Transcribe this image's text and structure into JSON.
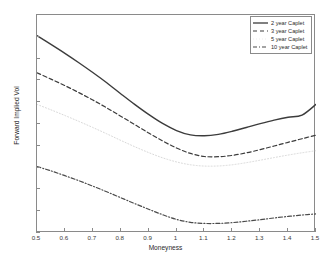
{
  "chart_data": {
    "type": "line",
    "title": "",
    "xlabel": "Moneyness",
    "ylabel": "Forward Implied Vol",
    "xlim": [
      0.5,
      1.5
    ],
    "ylim": [
      0.12,
      0.32
    ],
    "xticks": [
      "0.5",
      "0.6",
      "0.7",
      "0.8",
      "0.9",
      "1",
      "1.1",
      "1.2",
      "1.3",
      "1.4",
      "1.5"
    ],
    "xtick_values": [
      0.5,
      0.6,
      0.7,
      0.8,
      0.9,
      1.0,
      1.1,
      1.2,
      1.3,
      1.4,
      1.5
    ],
    "yticks": [
      "0.12",
      "0.14",
      "0.16",
      "0.18",
      "0.2",
      "0.22",
      "0.24",
      "0.26",
      "0.28",
      "0.3",
      "0.32"
    ],
    "ytick_values": [
      0.12,
      0.14,
      0.16,
      0.18,
      0.2,
      0.22,
      0.24,
      0.26,
      0.28,
      0.3,
      0.32
    ],
    "grid": false,
    "legend_position": "top-right",
    "x": [
      0.5,
      0.55,
      0.6,
      0.65,
      0.7,
      0.75,
      0.8,
      0.85,
      0.9,
      0.95,
      1.0,
      1.05,
      1.1,
      1.15,
      1.2,
      1.25,
      1.3,
      1.35,
      1.4,
      1.45,
      1.5
    ],
    "series": [
      {
        "name": "2 year Caplet",
        "style": "solid",
        "color": "#3c3c3c",
        "values": [
          0.301,
          0.293,
          0.2848,
          0.2762,
          0.2672,
          0.2578,
          0.2478,
          0.238,
          0.2288,
          0.2205,
          0.214,
          0.21,
          0.2092,
          0.2105,
          0.2133,
          0.2168,
          0.2203,
          0.2235,
          0.2262,
          0.2282,
          0.238
        ]
      },
      {
        "name": "3 year Caplet",
        "style": "dashed",
        "color": "#3c3c3c",
        "values": [
          0.267,
          0.2612,
          0.2552,
          0.2488,
          0.242,
          0.2348,
          0.2272,
          0.2195,
          0.2118,
          0.2045,
          0.198,
          0.193,
          0.1902,
          0.19,
          0.1912,
          0.1935,
          0.1965,
          0.1998,
          0.2032,
          0.2065,
          0.2098
        ]
      },
      {
        "name": "5 year Caplet",
        "style": "dotted-faint",
        "color": "#d8d8d8",
        "values": [
          0.238,
          0.233,
          0.2278,
          0.2224,
          0.2168,
          0.211,
          0.205,
          0.1992,
          0.1938,
          0.189,
          0.1852,
          0.1826,
          0.1814,
          0.1815,
          0.1826,
          0.1845,
          0.1868,
          0.1892,
          0.1915,
          0.1936,
          0.1955
        ]
      },
      {
        "name": "10 year Caplet",
        "style": "dash-dot",
        "color": "#4a4a4a",
        "values": [
          0.181,
          0.177,
          0.1726,
          0.168,
          0.163,
          0.1578,
          0.1524,
          0.147,
          0.1418,
          0.1368,
          0.1325,
          0.1298,
          0.1288,
          0.1288,
          0.1295,
          0.1308,
          0.1322,
          0.1338,
          0.1352,
          0.1365,
          0.1375
        ]
      }
    ]
  },
  "legend": {
    "items": [
      {
        "label": "2 year Caplet"
      },
      {
        "label": "3 year Caplet"
      },
      {
        "label": "5 year Caplet"
      },
      {
        "label": "10 year Caplet"
      }
    ]
  }
}
